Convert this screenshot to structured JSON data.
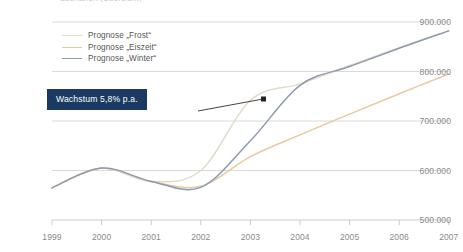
{
  "title_clipped": "Szenarien (Übersicht)",
  "callout": {
    "label": "Wachstum 5,8% p.a."
  },
  "colors": {
    "frost": "#e3dccc",
    "eiszeit": "#e8c8a0",
    "winter": "#8d9bb0",
    "grid": "#d9d9d9",
    "axis": "#cccccc",
    "tick_text": "#8a8a8a",
    "callout_bg": "#1b3a63",
    "callout_text": "#ffffff",
    "arrow": "#444444"
  },
  "chart_data": {
    "type": "line",
    "title": "",
    "xlabel": "",
    "ylabel": "",
    "grid": true,
    "legend_position": "top-left",
    "xlim": [
      1999,
      2007
    ],
    "ylim": [
      500000,
      900000
    ],
    "ytick_labels": [
      "900.000",
      "800.000",
      "700.000",
      "600.000",
      "500.000"
    ],
    "yticks": [
      900000,
      800000,
      700000,
      600000,
      500000
    ],
    "xtick_labels": [
      "1999",
      "2000",
      "2001",
      "2002",
      "2003",
      "2004",
      "2005",
      "2006",
      "2007"
    ],
    "x": [
      1999,
      2000,
      2001,
      2002,
      2003,
      2004,
      2005,
      2006,
      2007
    ],
    "series": [
      {
        "name": "Prognose „Frost“",
        "color": "#e3dccc",
        "values": [
          565000,
          605000,
          578000,
          600000,
          742000,
          775000,
          812000,
          848000,
          882000
        ]
      },
      {
        "name": "Prognose „Eiszeit“",
        "color": "#e8c8a0",
        "values": [
          565000,
          605000,
          578000,
          568000,
          628000,
          672000,
          714000,
          755000,
          795000
        ]
      },
      {
        "name": "Prognose „Winter“",
        "color": "#8d9bb0",
        "values": [
          565000,
          605000,
          578000,
          566000,
          660000,
          772000,
          810000,
          847000,
          882000
        ]
      }
    ],
    "annotations": [
      {
        "name": "growth-callout",
        "text": "Wachstum 5,8% p.a.",
        "points_to_x": 2003.0,
        "points_to_y": 742000
      }
    ]
  }
}
